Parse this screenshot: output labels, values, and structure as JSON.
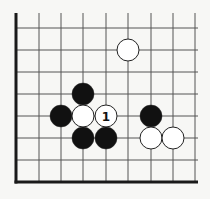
{
  "diagram": {
    "type": "go-board-fragment",
    "colors": {
      "background": "#f7f7f5",
      "line": "#555555",
      "edge": "#1a1a1a",
      "black_stone": "#111111",
      "white_stone": "#ffffff",
      "stone_outline": "#222222"
    },
    "grid": {
      "x": [
        16,
        39,
        61,
        83,
        106,
        128,
        151,
        173,
        195
      ],
      "y": [
        28,
        50,
        72,
        94,
        116,
        138,
        160,
        182
      ],
      "left_edge": true,
      "bottom_edge": true,
      "x_extent": [
        16,
        198
      ],
      "y_extent": [
        13,
        182
      ]
    },
    "stones": [
      {
        "color": "white",
        "col": 5,
        "row": 1,
        "label": ""
      },
      {
        "color": "black",
        "col": 3,
        "row": 3,
        "label": ""
      },
      {
        "color": "black",
        "col": 2,
        "row": 4,
        "label": ""
      },
      {
        "color": "white",
        "col": 3,
        "row": 4,
        "label": ""
      },
      {
        "color": "white",
        "col": 4,
        "row": 4,
        "label": "1"
      },
      {
        "color": "black",
        "col": 6,
        "row": 4,
        "label": ""
      },
      {
        "color": "black",
        "col": 3,
        "row": 5,
        "label": ""
      },
      {
        "color": "black",
        "col": 4,
        "row": 5,
        "label": ""
      },
      {
        "color": "white",
        "col": 6,
        "row": 5,
        "label": ""
      },
      {
        "color": "white",
        "col": 7,
        "row": 5,
        "label": ""
      }
    ],
    "stone_radius": 11
  }
}
